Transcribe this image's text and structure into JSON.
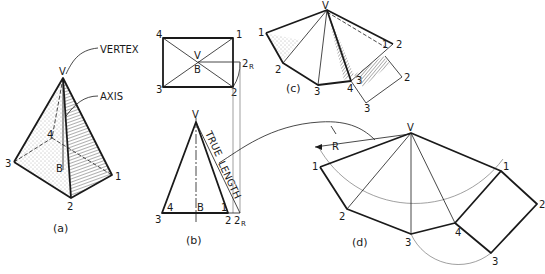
{
  "figure": {
    "a": {
      "caption": "(a)",
      "callouts": {
        "vertex": "VERTEX",
        "axis": "AXIS"
      },
      "labels": {
        "v": "V",
        "p1": "1",
        "p2": "2",
        "p3": "3",
        "p4": "4",
        "b": "B"
      }
    },
    "b": {
      "caption": "(b)",
      "top_view_labels": {
        "p4": "4",
        "p1": "1",
        "p3": "3",
        "p2": "2",
        "v": "V",
        "b": "B",
        "p2r": "2",
        "p2r_sub": "R"
      },
      "front_view_labels": {
        "v": "V",
        "p3": "3",
        "p4": "4",
        "b": "B",
        "p1": "1",
        "p2": "2",
        "p2r": "2",
        "p2r_sub": "R"
      },
      "true_length_text": {
        "word1": "TRUE",
        "word2": "LENGTH"
      }
    },
    "c": {
      "caption": "(c)",
      "labels": {
        "v": "V",
        "p1": "1",
        "p2": "2",
        "p3": "3",
        "p4": "4",
        "p1b": "1",
        "p2b": "2",
        "p3b": "3",
        "p2c": "2",
        "p3c": "3"
      }
    },
    "d": {
      "caption": "(d)",
      "radius_label": "R",
      "labels": {
        "v": "V",
        "p1": "1",
        "p2": "2",
        "p3": "3",
        "p4": "4",
        "p1b": "1",
        "p2b": "2",
        "p3b": "3"
      }
    }
  },
  "colors": {
    "line": "#1a1a1a",
    "construction": "#777777",
    "background": "#ffffff"
  }
}
